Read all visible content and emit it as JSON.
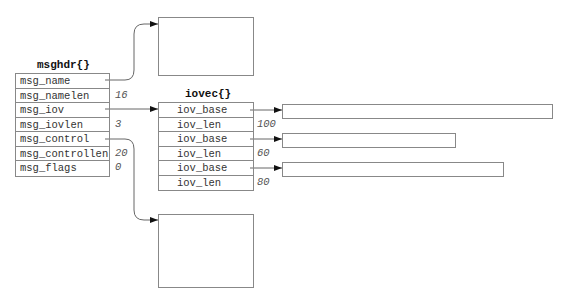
{
  "msghdr": {
    "title": "msghdr{}",
    "fields": [
      {
        "name": "msg_name",
        "value": ""
      },
      {
        "name": "msg_namelen",
        "value": "16"
      },
      {
        "name": "msg_iov",
        "value": ""
      },
      {
        "name": "msg_iovlen",
        "value": "3"
      },
      {
        "name": "msg_control",
        "value": ""
      },
      {
        "name": "msg_controllen",
        "value": "20"
      },
      {
        "name": "msg_flags",
        "value": "0"
      }
    ]
  },
  "iovec": {
    "title": "iovec{}",
    "fields": [
      {
        "name": "iov_base",
        "value": ""
      },
      {
        "name": "iov_len",
        "value": "100"
      },
      {
        "name": "iov_base",
        "value": ""
      },
      {
        "name": "iov_len",
        "value": "60"
      },
      {
        "name": "iov_base",
        "value": ""
      },
      {
        "name": "iov_len",
        "value": "80"
      }
    ]
  },
  "colors": {
    "line": "#888888",
    "arrow": "#111111",
    "text": "#333333"
  }
}
